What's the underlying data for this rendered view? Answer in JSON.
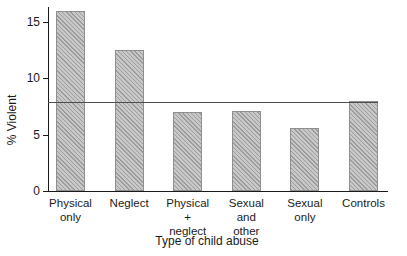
{
  "figure": {
    "ylabel": "% Violent",
    "xlabel": "Type of child abuse"
  },
  "chart_data": {
    "type": "bar",
    "title": "",
    "xlabel": "Type of child abuse",
    "ylabel": "% Violent",
    "categories": [
      "Physical only",
      "Neglect",
      "Physical + neglect",
      "Sexual and other",
      "Sexual only",
      "Controls"
    ],
    "category_label_lines": [
      [
        "Physical",
        "only"
      ],
      [
        "Neglect"
      ],
      [
        "Physical",
        "+",
        "neglect"
      ],
      [
        "Sexual",
        "and",
        "other"
      ],
      [
        "Sexual",
        "only"
      ],
      [
        "Controls"
      ]
    ],
    "values": [
      16.0,
      12.5,
      7.0,
      7.1,
      5.6,
      8.0
    ],
    "reference_line": 7.9,
    "ylim": [
      0,
      16.5
    ],
    "yticks": [
      0,
      5,
      10,
      15
    ],
    "grid": false,
    "legend": "none",
    "bar_style": "gray-diagonal-hatch"
  },
  "colors": {
    "background": "#ffffff",
    "bar_fill": "#c8c8c8",
    "bar_hatch": "#787878",
    "bar_border": "#8f8f8f",
    "axis": "#1a1a1a",
    "reference_line": "#4d4d4d",
    "text": "#1a1a1a"
  }
}
